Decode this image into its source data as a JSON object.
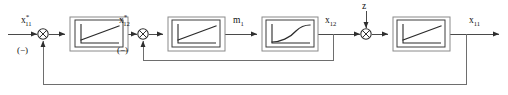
{
  "diagram": {
    "type": "block-diagram",
    "canvas": {
      "width": 508,
      "height": 95
    },
    "colors": {
      "background": "#ffffff",
      "wire": "#4a4a4a",
      "feedback_wire": "#6e6e6e",
      "block_border": "#3d3d3d",
      "block_shadow_border": "#8a8a8a",
      "text": "#111111"
    },
    "signals": [
      {
        "id": "input-x11-star",
        "base": "x",
        "superscript": "*",
        "subscript": "11",
        "text": "x*11",
        "role": "reference-input"
      },
      {
        "id": "x12-star",
        "base": "x",
        "superscript": "*",
        "subscript": "12",
        "text": "x*12",
        "role": "inner-loop-reference"
      },
      {
        "id": "m1",
        "base": "m",
        "superscript": "",
        "subscript": "1",
        "text": "m1",
        "role": "manipulated-variable"
      },
      {
        "id": "x12",
        "base": "x",
        "superscript": "",
        "subscript": "12",
        "text": "x12",
        "role": "inner-loop-feedback-variable"
      },
      {
        "id": "z",
        "base": "z",
        "superscript": "",
        "subscript": "",
        "text": "z",
        "role": "disturbance-input"
      },
      {
        "id": "output-x11",
        "base": "x",
        "superscript": "",
        "subscript": "11",
        "text": "x11",
        "role": "controlled-output"
      }
    ],
    "summing_junctions": [
      {
        "id": "sum-1",
        "sign_label": "(−)",
        "inputs": [
          "input-x11-star",
          "outer-feedback"
        ]
      },
      {
        "id": "sum-2",
        "sign_label": "(−)",
        "inputs": [
          "x12-star",
          "inner-feedback"
        ]
      },
      {
        "id": "sum-3",
        "sign_label": "",
        "inputs": [
          "x12",
          "z"
        ]
      }
    ],
    "blocks": [
      {
        "id": "block-1",
        "icon": "saturation-icon",
        "label": "",
        "description": "saturation / limiter characteristic"
      },
      {
        "id": "block-2",
        "icon": "saturation-icon",
        "label": "",
        "description": "saturation / limiter characteristic"
      },
      {
        "id": "block-3",
        "icon": "first-order-lag-icon",
        "label": "",
        "description": "first order lag step response"
      },
      {
        "id": "block-4",
        "icon": "saturation-icon",
        "label": "",
        "description": "saturation / limiter characteristic"
      }
    ],
    "feedback_paths": [
      {
        "id": "inner-feedback",
        "from": "x12",
        "to": "sum-2",
        "sign": "(−)"
      },
      {
        "id": "outer-feedback",
        "from": "output-x11",
        "to": "sum-1",
        "sign": "(−)"
      }
    ]
  }
}
